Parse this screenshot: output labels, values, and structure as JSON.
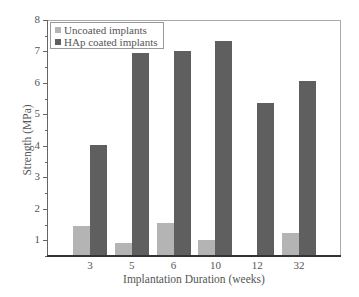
{
  "chart_data": {
    "type": "bar",
    "title": "",
    "xlabel": "Implantation Duration (weeks)",
    "ylabel": "Strength (MPa)",
    "categories": [
      "3",
      "5",
      "6",
      "10",
      "12",
      "32"
    ],
    "series": [
      {
        "name": "Uncoated implants",
        "color": "#b4b4b4",
        "values": [
          1.45,
          0.92,
          1.55,
          1.0,
          null,
          1.22
        ]
      },
      {
        "name": "HAp coated implants",
        "color": "#5f5f5f",
        "values": [
          4.02,
          6.96,
          7.0,
          7.32,
          5.35,
          6.07
        ]
      }
    ],
    "ylim": [
      0.5,
      8
    ],
    "yticks": [
      1,
      2,
      3,
      4,
      5,
      6,
      7,
      8
    ],
    "grid": false,
    "legend_position": "upper left"
  },
  "legend": {
    "items": [
      {
        "label": "Uncoated implants",
        "color": "#b4b4b4"
      },
      {
        "label": "HAp coated implants",
        "color": "#5f5f5f"
      }
    ]
  }
}
